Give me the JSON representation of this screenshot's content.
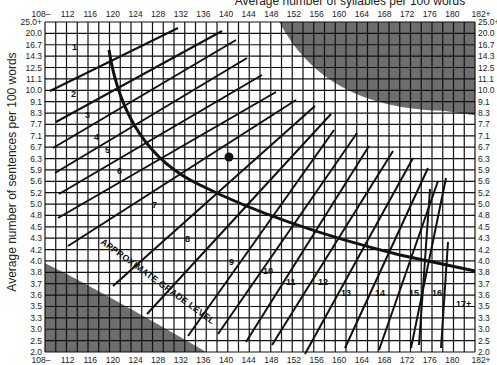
{
  "chart_data": {
    "type": "line",
    "xlabel": "Average number of syllables per 100 words",
    "ylabel": "Average number of sentences per 100 words",
    "x_tick_labels": [
      "108–",
      "112",
      "116",
      "120",
      "124",
      "128",
      "132",
      "136",
      "140",
      "144",
      "148",
      "152",
      "156",
      "160",
      "164",
      "168",
      "172",
      "176",
      "180",
      "182+"
    ],
    "y_tick_labels": [
      "25.0+",
      "20.0",
      "16.7",
      "14.3",
      "12.5",
      "11.1",
      "10.0",
      "9.1",
      "8.3",
      "7.7",
      "7.1",
      "6.7",
      "6.3",
      "5.9",
      "5.6",
      "5.2",
      "5.0",
      "4.8",
      "4.5",
      "4.3",
      "4.2",
      "4.0",
      "3.8",
      "3.7",
      "3.6",
      "3.5",
      "3.3",
      "3.0",
      "2.5",
      "2.0"
    ],
    "grid": true,
    "annotations": {
      "curve_label": "APPROXIMATE GRADE LEVEL",
      "grade_labels": [
        "1",
        "2",
        "3",
        "4",
        "5",
        "6",
        "7",
        "8",
        "9",
        "10",
        "11",
        "12",
        "13",
        "14",
        "15",
        "16",
        "17+"
      ],
      "marked_point": {
        "syllables": 141,
        "sentences": 6.3
      }
    },
    "shaded_regions": [
      "upper-right (invalid)",
      "lower-left (invalid)"
    ]
  },
  "colors": {
    "grid": "#111111",
    "shade": "#6e6e6e",
    "background": "#ffffff"
  }
}
